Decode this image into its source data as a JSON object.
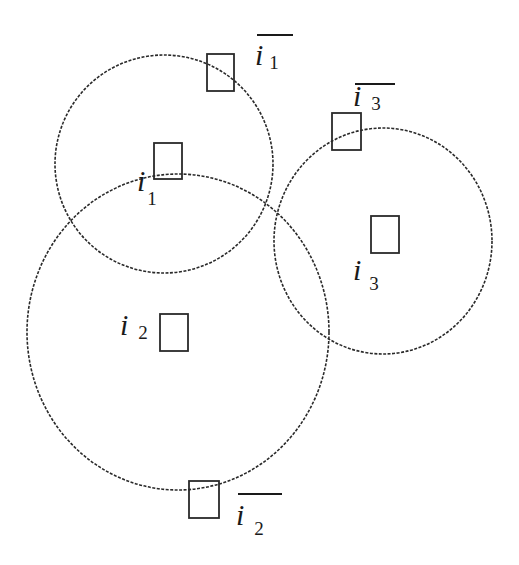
{
  "diagram": {
    "stroke_color": "#2a2a2a",
    "background": "#ffffff",
    "circles": [
      {
        "id": "circle-1",
        "cx": 164,
        "cy": 164,
        "rx": 109,
        "ry": 109
      },
      {
        "id": "circle-2",
        "cx": 178,
        "cy": 332,
        "rx": 151,
        "ry": 158
      },
      {
        "id": "circle-3",
        "cx": 383,
        "cy": 241,
        "rx": 109,
        "ry": 113
      }
    ],
    "squares": [
      {
        "id": "item-i1-bar",
        "x": 207,
        "y": 54,
        "w": 27,
        "h": 37
      },
      {
        "id": "item-i1",
        "x": 154,
        "y": 143,
        "w": 28,
        "h": 36
      },
      {
        "id": "item-i3-bar",
        "x": 332,
        "y": 113,
        "w": 29,
        "h": 37
      },
      {
        "id": "item-i3",
        "x": 371,
        "y": 216,
        "w": 28,
        "h": 37
      },
      {
        "id": "item-i2",
        "x": 160,
        "y": 314,
        "w": 28,
        "h": 37
      },
      {
        "id": "item-i2-bar",
        "x": 189,
        "y": 481,
        "w": 30,
        "h": 37
      }
    ],
    "labels": {
      "i1_bar": {
        "var": "i",
        "sub": "1",
        "overline": true
      },
      "i1": {
        "var": "i",
        "sub": "1",
        "overline": false
      },
      "i3_bar": {
        "var": "i",
        "sub": "3",
        "overline": true
      },
      "i3": {
        "var": "i",
        "sub": "3",
        "overline": false
      },
      "i2": {
        "var": "i",
        "sub": "2",
        "overline": false
      },
      "i2_bar": {
        "var": "i",
        "sub": "2",
        "overline": true
      }
    }
  }
}
